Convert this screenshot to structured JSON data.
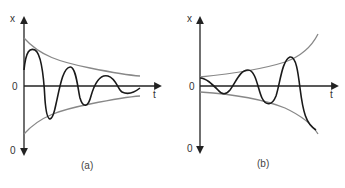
{
  "figure": {
    "panels": [
      {
        "id": "a",
        "caption": "(a)",
        "y_axis_label": "x",
        "x_axis_label": "t",
        "origin_label": "0",
        "bottom_label": "0",
        "description": "Damped oscillation: signal decays within a shrinking envelope"
      },
      {
        "id": "b",
        "caption": "(b)",
        "y_axis_label": "x",
        "x_axis_label": "t",
        "origin_label": "0",
        "bottom_label": "0",
        "description": "Growing oscillation: signal amplitude increases within an expanding envelope"
      }
    ],
    "colors": {
      "axis": "#222222",
      "signal": "#1a1a1a",
      "envelope": "#888888"
    }
  }
}
